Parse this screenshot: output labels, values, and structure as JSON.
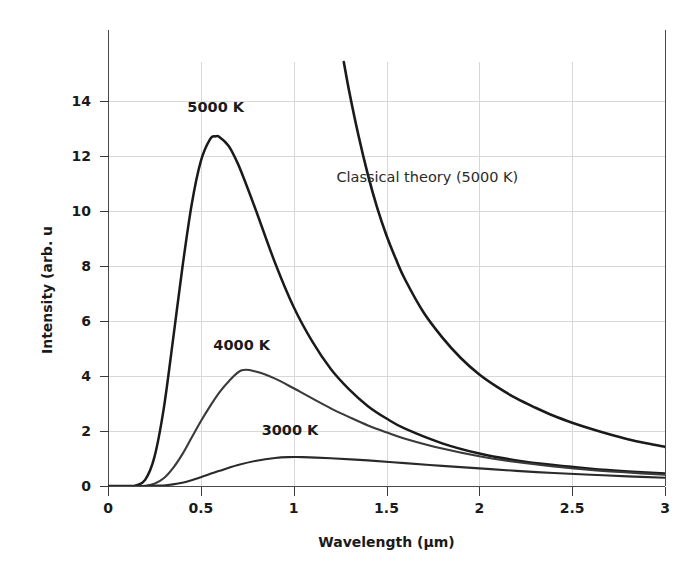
{
  "chart_data": {
    "type": "line",
    "title": "",
    "xlabel": "Wavelength (µm)",
    "ylabel": "Intensity (arb. u",
    "xlim": [
      0,
      3
    ],
    "ylim": [
      0,
      15.4
    ],
    "xticks": [
      "0",
      "0.5",
      "1",
      "1.5",
      "2",
      "2.5",
      "3"
    ],
    "xtick_values": [
      0,
      0.5,
      1,
      1.5,
      2,
      2.5,
      3
    ],
    "yticks": [
      "0",
      "2",
      "4",
      "6",
      "8",
      "10",
      "12",
      "14"
    ],
    "ytick_values": [
      0,
      2,
      4,
      6,
      8,
      10,
      12,
      14
    ],
    "grid": true,
    "legend_position": "inline-annotations",
    "series": [
      {
        "name": "5000 K",
        "label": "5000 K",
        "color": "#1a1a1a",
        "peak_x": 0.58,
        "peak_y": 12.7,
        "x": [
          0.0,
          0.1,
          0.15,
          0.2,
          0.25,
          0.3,
          0.35,
          0.4,
          0.45,
          0.5,
          0.55,
          0.58,
          0.6,
          0.65,
          0.7,
          0.75,
          0.8,
          0.9,
          1.0,
          1.1,
          1.2,
          1.3,
          1.4,
          1.5,
          1.6,
          1.8,
          2.0,
          2.2,
          2.4,
          2.6,
          2.8,
          3.0
        ],
        "y": [
          0.0,
          0.0,
          0.02,
          0.22,
          1.05,
          2.8,
          5.3,
          7.9,
          10.2,
          11.8,
          12.6,
          12.7,
          12.68,
          12.35,
          11.7,
          10.85,
          9.95,
          8.1,
          6.5,
          5.25,
          4.25,
          3.5,
          2.9,
          2.45,
          2.08,
          1.55,
          1.18,
          0.93,
          0.76,
          0.63,
          0.53,
          0.45
        ]
      },
      {
        "name": "4000 K",
        "label": "4000 K",
        "color": "#3a3a3a",
        "peak_x": 0.72,
        "peak_y": 4.2,
        "x": [
          0.0,
          0.15,
          0.2,
          0.25,
          0.3,
          0.35,
          0.4,
          0.45,
          0.5,
          0.55,
          0.6,
          0.65,
          0.72,
          0.8,
          0.9,
          1.0,
          1.1,
          1.2,
          1.3,
          1.4,
          1.5,
          1.6,
          1.8,
          2.0,
          2.2,
          2.4,
          2.6,
          2.8,
          3.0
        ],
        "y": [
          0.0,
          0.0,
          0.01,
          0.08,
          0.28,
          0.65,
          1.15,
          1.75,
          2.35,
          2.9,
          3.4,
          3.8,
          4.2,
          4.15,
          3.9,
          3.55,
          3.18,
          2.82,
          2.5,
          2.2,
          1.95,
          1.72,
          1.36,
          1.08,
          0.87,
          0.71,
          0.58,
          0.49,
          0.41
        ]
      },
      {
        "name": "3000 K",
        "label": "3000 K",
        "color": "#2a2a2a",
        "peak_x": 0.97,
        "peak_y": 1.05,
        "x": [
          0.0,
          0.2,
          0.25,
          0.3,
          0.35,
          0.4,
          0.45,
          0.5,
          0.6,
          0.7,
          0.8,
          0.9,
          0.97,
          1.05,
          1.2,
          1.4,
          1.6,
          1.8,
          2.0,
          2.2,
          2.4,
          2.6,
          2.8,
          3.0
        ],
        "y": [
          0.0,
          0.0,
          0.01,
          0.02,
          0.06,
          0.12,
          0.21,
          0.32,
          0.55,
          0.76,
          0.92,
          1.02,
          1.05,
          1.05,
          1.01,
          0.93,
          0.83,
          0.73,
          0.64,
          0.55,
          0.47,
          0.41,
          0.35,
          0.3
        ]
      },
      {
        "name": "Classical theory (5000 K)",
        "label": "Classical theory (5000 K)",
        "color": "#1a1a1a",
        "x": [
          1.27,
          1.3,
          1.35,
          1.4,
          1.45,
          1.5,
          1.55,
          1.6,
          1.7,
          1.8,
          1.9,
          2.0,
          2.1,
          2.2,
          2.3,
          2.4,
          2.5,
          2.6,
          2.7,
          2.8,
          2.9,
          3.0
        ],
        "y": [
          15.4,
          14.3,
          12.7,
          11.3,
          10.1,
          9.1,
          8.25,
          7.5,
          6.3,
          5.4,
          4.65,
          4.05,
          3.58,
          3.18,
          2.85,
          2.55,
          2.3,
          2.08,
          1.88,
          1.7,
          1.55,
          1.42
        ]
      }
    ],
    "annotations": [
      {
        "name": "label-5000k",
        "text": "5000 K",
        "x": 0.58,
        "y": 13.6
      },
      {
        "name": "label-4000k",
        "text": "4000 K",
        "x": 0.72,
        "y": 4.95
      },
      {
        "name": "label-3000k",
        "text": "3000 K",
        "x": 0.98,
        "y": 1.85
      },
      {
        "name": "label-classical",
        "text": "Classical theory (5000 K)",
        "x": 1.72,
        "y": 11.05
      }
    ],
    "colors": {
      "background": "#ffffff",
      "grid": "#d8d8d8",
      "axis": "#4a4a4a",
      "text": "#1a1a1a"
    }
  }
}
